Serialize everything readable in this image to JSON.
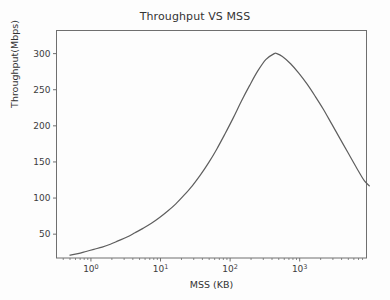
{
  "chart_data": {
    "type": "line",
    "title": "Throughput VS MSS",
    "xlabel": "MSS (KB)",
    "ylabel": "Throughput(Mbps)",
    "xscale": "log",
    "yscale": "linear",
    "xlim": [
      0.32,
      9120
    ],
    "ylim": [
      17,
      332
    ],
    "grid": false,
    "legend": null,
    "line_color": "#5e5e5e",
    "xticks": [
      {
        "value": 1,
        "label": "10",
        "exponent": "0"
      },
      {
        "value": 10,
        "label": "10",
        "exponent": "1"
      },
      {
        "value": 100,
        "label": "10",
        "exponent": "2"
      },
      {
        "value": 1000,
        "label": "10",
        "exponent": "3"
      },
      {
        "value": 10000,
        "label": "10",
        "exponent": "4"
      }
    ],
    "yticks": [
      50,
      100,
      150,
      200,
      250,
      300
    ],
    "series": [
      {
        "name": "Throughput",
        "x": [
          0.5,
          0.65,
          0.85,
          1.1,
          1.45,
          1.9,
          2.5,
          3.3,
          4.3,
          5.6,
          7.4,
          9.7,
          12.7,
          16.6,
          21.8,
          28.6,
          37.5,
          49.2,
          64.5,
          84.6,
          111,
          145,
          191,
          250,
          328,
          430,
          470,
          564,
          740,
          970,
          1272,
          1668,
          2187,
          2868,
          3760,
          4930,
          6465,
          8477,
          10000
        ],
        "y": [
          21,
          23,
          26,
          29,
          32,
          36,
          41,
          46,
          52,
          58,
          65,
          73,
          82,
          92,
          104,
          117,
          132,
          149,
          168,
          189,
          211,
          234,
          256,
          276,
          292,
          300,
          300,
          296,
          286,
          273,
          258,
          241,
          223,
          203,
          183,
          163,
          143,
          124,
          117
        ]
      }
    ],
    "annotations": {
      "peak_x": 450,
      "peak_y": 300
    }
  }
}
